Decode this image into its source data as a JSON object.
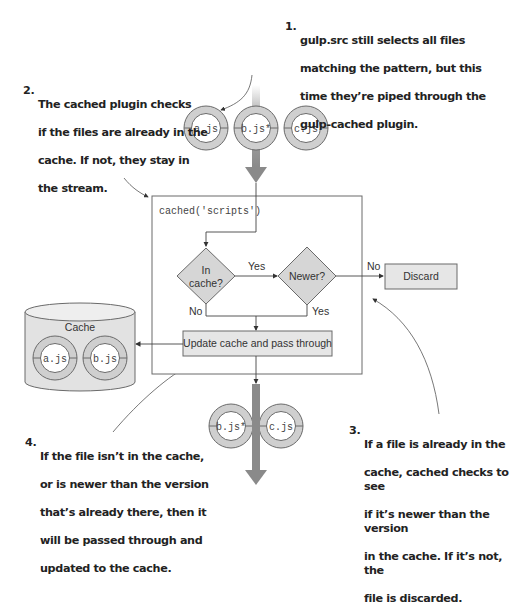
{
  "annotations": [
    {
      "id": "1",
      "num": "1.",
      "lines": [
        "gulp.src still selects all files",
        "matching the pattern, but this",
        "time they’re piped through the",
        "gulp-cached plugin."
      ]
    },
    {
      "id": "2",
      "num": "2.",
      "lines": [
        "The cached plugin checks",
        "if the files are already in the",
        "cache. If not, they stay in",
        "the stream."
      ]
    },
    {
      "id": "3",
      "num": "3.",
      "lines": [
        "If a file is already in the",
        "cache, cached checks to see",
        "if it’s newer than the version",
        "in the cache. If it’s not, the",
        "file is discarded."
      ]
    },
    {
      "id": "4",
      "num": "4.",
      "lines": [
        "If the file isn’t in the cache,",
        "or is newer than the version",
        "that’s already there, then it",
        "will be passed through and",
        "updated to the cache."
      ]
    }
  ],
  "input_files": [
    "a.js",
    "b.js*",
    "c.js"
  ],
  "output_files": [
    "b.js*",
    "c.js"
  ],
  "cache": {
    "label": "Cache",
    "files": [
      "a.js",
      "b.js"
    ]
  },
  "plugin_box": {
    "label": "cached('scripts')"
  },
  "decisions": {
    "in_cache_line1": "In",
    "in_cache_line2": "cache?",
    "newer": "Newer?"
  },
  "edge_labels": {
    "yes1": "Yes",
    "no1": "No",
    "yes2": "Yes",
    "no2": "No"
  },
  "actions": {
    "discard": "Discard",
    "update": "Update cache and pass through"
  },
  "colors": {
    "ring": "#cfcfcf",
    "ring_stroke": "#6a6a6a",
    "box_fill": "#e6e6e6",
    "line": "#444444",
    "stream": "#8a8a8a"
  }
}
